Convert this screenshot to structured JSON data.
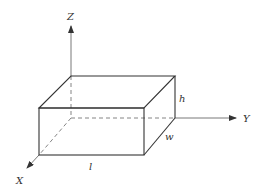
{
  "diagram": {
    "type": "3d-box-coordinate-system",
    "axes": {
      "z": {
        "label": "Z"
      },
      "y": {
        "label": "Y"
      },
      "x": {
        "label": "X"
      }
    },
    "dimensions": {
      "length": {
        "label": "l"
      },
      "width": {
        "label": "w"
      },
      "height": {
        "label": "h"
      }
    },
    "colors": {
      "stroke": "#333333",
      "background": "#ffffff"
    }
  }
}
